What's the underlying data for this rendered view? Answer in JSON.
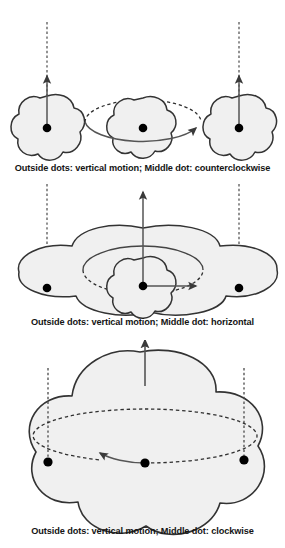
{
  "figure": {
    "background_color": "#ffffff",
    "shape_fill_color": "#f0f0f0",
    "stroke_color": "#333333",
    "dot_color": "#000000",
    "caption_color": "#141414"
  },
  "panels": [
    {
      "id": "panel-1",
      "caption": "Outside dots: vertical motion; Middle dot: counterclockwise",
      "shapes": [
        {
          "name": "left-flower",
          "type": "flower",
          "lobes": 5,
          "center_x": 47,
          "center_y": 128,
          "radius": 32,
          "dot": {
            "x": 47,
            "y": 128,
            "r": 4.2
          },
          "arrow": {
            "type": "vertical-up",
            "from_y": 128,
            "to_y": 72,
            "dashed_above": true,
            "dash_top_y": 22
          }
        },
        {
          "name": "middle-flower",
          "type": "flower",
          "lobes": 5,
          "center_x": 143,
          "center_y": 128,
          "radius": 30,
          "dot": {
            "x": 143,
            "y": 128,
            "r": 4.2
          },
          "orbit": {
            "type": "ellipse",
            "cx": 143,
            "cy": 110,
            "rx": 58,
            "ry": 22,
            "direction": "counterclockwise",
            "front_solid": true
          }
        },
        {
          "name": "right-flower",
          "type": "flower",
          "lobes": 5,
          "center_x": 239,
          "center_y": 128,
          "radius": 32,
          "dot": {
            "x": 239,
            "y": 128,
            "r": 4.2
          },
          "arrow": {
            "type": "vertical-up",
            "from_y": 128,
            "to_y": 72,
            "dashed_above": true,
            "dash_top_y": 22
          }
        }
      ]
    },
    {
      "id": "panel-2",
      "caption": "Outside dots: vertical motion; Middle dot: horizontal",
      "shapes": [
        {
          "name": "wide-cloud",
          "type": "wide-flower",
          "lobes": 5,
          "center_x": 143,
          "center_y": 100,
          "rx": 130,
          "ry": 48,
          "dots": [
            {
              "name": "left-dot",
              "x": 47,
              "y": 110,
              "r": 4.2
            },
            {
              "name": "middle-dot",
              "x": 143,
              "y": 108,
              "r": 4.2
            },
            {
              "name": "right-dot",
              "x": 239,
              "y": 110,
              "r": 4.2
            }
          ],
          "dashed_verticals": [
            {
              "x": 47,
              "top_y": 14,
              "bottom_y": 110
            },
            {
              "x": 239,
              "top_y": 14,
              "bottom_y": 110
            }
          ],
          "center_flower": {
            "center_x": 143,
            "center_y": 108,
            "radius": 28,
            "lobes": 5
          },
          "orbit": {
            "type": "ellipse",
            "cx": 143,
            "cy": 92,
            "rx": 60,
            "ry": 24,
            "front_dashed": true
          },
          "arrows": [
            {
              "name": "vertical-arrow",
              "type": "vertical-up",
              "from_y": 108,
              "to_y": 22
            },
            {
              "name": "horizontal-arrow",
              "type": "horizontal-right",
              "from_x": 143,
              "to_x": 200,
              "y": 108
            }
          ]
        }
      ]
    },
    {
      "id": "panel-3",
      "caption": "Outside dots: vertical motion; Middle dot: clockwise",
      "shapes": [
        {
          "name": "large-flower",
          "type": "flower",
          "lobes": 5,
          "center_x": 140,
          "center_y": 106,
          "radius": 95,
          "dots": [
            {
              "name": "left-dot",
              "x": 48,
              "y": 122,
              "r": 4.5
            },
            {
              "name": "middle-dot",
              "x": 145,
              "y": 123,
              "r": 4.5
            },
            {
              "name": "right-dot",
              "x": 244,
              "y": 120,
              "r": 4.5
            }
          ],
          "dashed_verticals": [
            {
              "x": 48,
              "top_y": 28,
              "bottom_y": 122
            },
            {
              "x": 244,
              "top_y": 28,
              "bottom_y": 120
            }
          ],
          "orbit": {
            "type": "ellipse",
            "cx": 145,
            "cy": 98,
            "rx": 112,
            "ry": 27,
            "direction": "clockwise",
            "front_solid_left": true
          },
          "arrow": {
            "name": "vertical-arrow",
            "type": "vertical-up",
            "from_y": 40,
            "to_y": 2,
            "x": 145
          }
        }
      ]
    }
  ]
}
